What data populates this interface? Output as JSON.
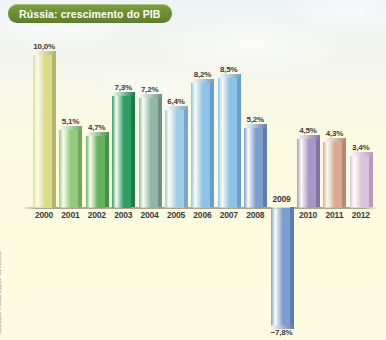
{
  "title": "Rússia: crescimento do PIB",
  "credit": "Cassiano Róda/Arquivo da editora",
  "chart_data": {
    "type": "bar",
    "title": "Rússia: crescimento do PIB",
    "xlabel": "",
    "ylabel": "",
    "unit": "%",
    "grid": false,
    "legend": "none",
    "ylim": [
      -8,
      10.5
    ],
    "categories": [
      "2000",
      "2001",
      "2002",
      "2003",
      "2004",
      "2005",
      "2006",
      "2007",
      "2008",
      "2009",
      "2010",
      "2011",
      "2012"
    ],
    "values": [
      10.0,
      5.1,
      4.7,
      7.3,
      7.2,
      6.4,
      8.2,
      8.5,
      5.2,
      -7.8,
      4.5,
      4.3,
      3.4
    ],
    "value_labels": [
      "10,0%",
      "5,1%",
      "4,7%",
      "7,3%",
      "7,2%",
      "6,4%",
      "8,2%",
      "8,5%",
      "5,2%",
      "−7,8%",
      "4,5%",
      "4,3%",
      "3,4%"
    ],
    "colors": [
      "#dcdc8c",
      "#93c97a",
      "#63b25e",
      "#2f9e63",
      "#8fb8a8",
      "#9fcde8",
      "#8cc2e6",
      "#8cc2e6",
      "#7b9fd0",
      "#7b9fd0",
      "#a797c9",
      "#dba894",
      "#dec2dd"
    ],
    "side_colors": [
      "#b4b46a",
      "#6fa85a",
      "#47904a",
      "#1f7a49",
      "#6d9184",
      "#7aa8c4",
      "#6b9ec4",
      "#6b9ec4",
      "#5f7eab",
      "#5f7eab",
      "#83749f",
      "#b88770",
      "#b89bb7"
    ]
  },
  "colors": {
    "banner": "#6d9036",
    "banner_text": "#ffffff",
    "label_text": "#3b3b3b",
    "background_top": "#eef3f6",
    "background_bottom": "#fdfce1",
    "baseline": "#8c8c78"
  }
}
